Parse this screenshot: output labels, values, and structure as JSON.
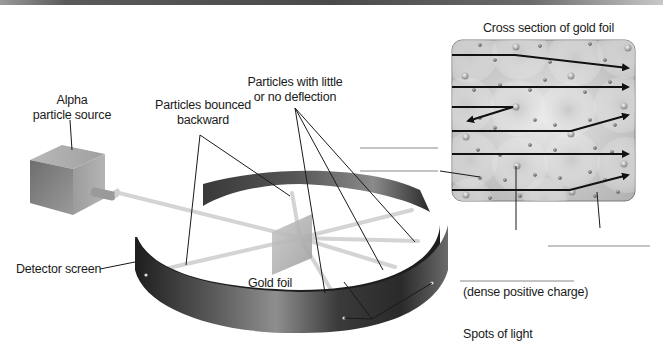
{
  "diagram": {
    "labels": {
      "alpha_source_line1": "Alpha",
      "alpha_source_line2": "particle source",
      "bounced_line1": "Particles bounced",
      "bounced_line2": "backward",
      "little_deflection_line1": "Particles with little",
      "little_deflection_line2": "or no deflection",
      "detector_screen": "Detector screen",
      "gold_foil": "Gold foil",
      "spots_of_light": "Spots of light",
      "cross_section_title": "Cross section of gold foil",
      "dense_positive_charge": "(dense positive charge)"
    },
    "blank_answer_lines": [
      {
        "id": "blank-1",
        "x1": 360,
        "y1": 148,
        "x2": 438,
        "y2": 148
      },
      {
        "id": "blank-2",
        "x1": 360,
        "y1": 171,
        "x2": 438,
        "y2": 171
      },
      {
        "id": "blank-3",
        "x1": 460,
        "y1": 281,
        "x2": 574,
        "y2": 281
      },
      {
        "id": "blank-4",
        "x1": 548,
        "y1": 246,
        "x2": 650,
        "y2": 246
      }
    ],
    "colors": {
      "text": "#1a1a1a",
      "leader_line": "#1a1a1a",
      "blank_line": "#888888",
      "beam": "#d4d4d4",
      "ring_dark": "#2a2a2a",
      "ring_light": "#9a9a9a",
      "foil_box": "#bdbdbd",
      "arrow": "#111111"
    }
  }
}
